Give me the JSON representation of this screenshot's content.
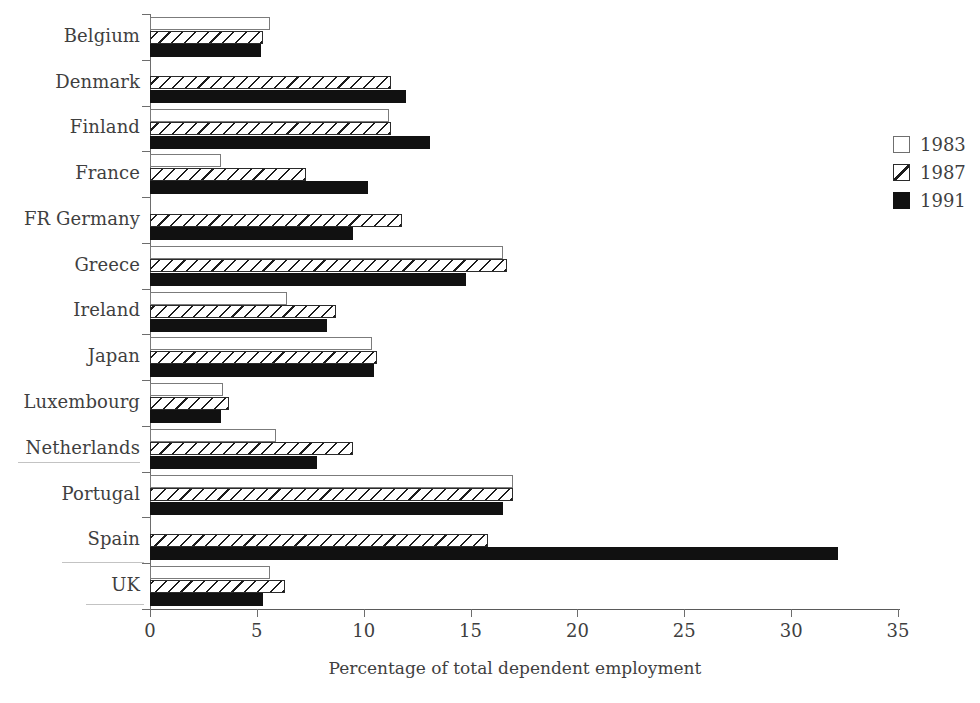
{
  "chart_data": {
    "type": "bar",
    "orientation": "horizontal",
    "title": "",
    "xlabel": "Percentage of  total dependent employment",
    "ylabel": "",
    "xlim": [
      0,
      35
    ],
    "xticks": [
      0,
      5,
      10,
      15,
      20,
      25,
      30,
      35
    ],
    "grid": false,
    "legend_position": "right",
    "categories": [
      "Belgium",
      "Denmark",
      "Finland",
      "France",
      "FR Germany",
      "Greece",
      "Ireland",
      "Japan",
      "Luxembourg",
      "Netherlands",
      "Portugal",
      "Spain",
      "UK"
    ],
    "series": [
      {
        "name": "1983",
        "style": "open",
        "color": "#ffffff",
        "values": [
          5.6,
          0,
          11.2,
          3.3,
          0,
          16.5,
          6.4,
          10.4,
          3.4,
          5.9,
          17.0,
          0,
          5.6
        ]
      },
      {
        "name": "1987",
        "style": "hatched",
        "color": "#ffffff",
        "values": [
          5.3,
          11.3,
          11.3,
          7.3,
          11.8,
          16.7,
          8.7,
          10.6,
          3.7,
          9.5,
          17.0,
          15.8,
          6.3
        ]
      },
      {
        "name": "1991",
        "style": "solid",
        "color": "#111111",
        "values": [
          5.2,
          12.0,
          13.1,
          10.2,
          9.5,
          14.8,
          8.3,
          10.5,
          3.3,
          7.8,
          16.5,
          32.2,
          5.3
        ]
      }
    ]
  },
  "legend": {
    "items": [
      {
        "label": "1983",
        "swatch": "open-square-swatch"
      },
      {
        "label": "1987",
        "swatch": "hatched-square-swatch"
      },
      {
        "label": "1991",
        "swatch": "solid-square-swatch"
      }
    ]
  }
}
